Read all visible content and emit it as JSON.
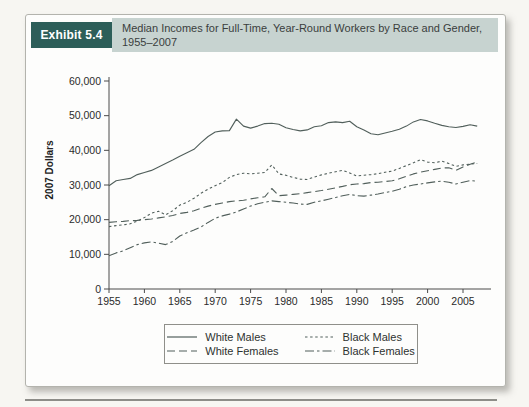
{
  "header": {
    "exhibit_label": "Exhibit 5.4",
    "title": "Median Incomes for Full-Time, Year-Round Workers by Race and Gender, 1955–2007"
  },
  "colors": {
    "exhibit_box_bg": "#2d5e59",
    "title_band_bg": "#c7d3d0",
    "line_color": "#515f5b",
    "axis_color": "#4b4b4b",
    "tick_text": "#2b2b2b"
  },
  "chart_data": {
    "type": "line",
    "title": "Median Incomes for Full-Time, Year-Round Workers by Race and Gender, 1955–2007",
    "xlabel": "",
    "ylabel": "2007 Dollars",
    "ylim": [
      0,
      60000
    ],
    "yticks": [
      0,
      10000,
      20000,
      30000,
      40000,
      50000,
      60000
    ],
    "ytick_labels": [
      "0",
      "10,000",
      "20,000",
      "30,000",
      "40,000",
      "50,000",
      "60,000"
    ],
    "xticks": [
      1955,
      1960,
      1965,
      1970,
      1975,
      1980,
      1985,
      1990,
      1995,
      2000,
      2005
    ],
    "grid": false,
    "legend_position": "bottom",
    "x": [
      1955,
      1956,
      1957,
      1958,
      1959,
      1960,
      1961,
      1962,
      1963,
      1964,
      1965,
      1966,
      1967,
      1968,
      1969,
      1970,
      1971,
      1972,
      1973,
      1974,
      1975,
      1976,
      1977,
      1978,
      1979,
      1980,
      1981,
      1982,
      1983,
      1984,
      1985,
      1986,
      1987,
      1988,
      1989,
      1990,
      1991,
      1992,
      1993,
      1994,
      1995,
      1996,
      1997,
      1998,
      1999,
      2000,
      2001,
      2002,
      2003,
      2004,
      2005,
      2006,
      2007
    ],
    "series": [
      {
        "name": "White Males",
        "style": "solid",
        "values": [
          29800,
          31200,
          31600,
          31900,
          33000,
          33600,
          34200,
          35200,
          36200,
          37200,
          38300,
          39300,
          40300,
          42200,
          44000,
          45300,
          45600,
          45700,
          49000,
          47000,
          46400,
          47000,
          47700,
          47800,
          47500,
          46500,
          46000,
          45600,
          45900,
          46800,
          47100,
          48000,
          48200,
          48000,
          48400,
          46800,
          45900,
          44800,
          44500,
          45000,
          45500,
          46100,
          47000,
          48200,
          48900,
          48500,
          47800,
          47200,
          46800,
          46600,
          46900,
          47400,
          47000
        ]
      },
      {
        "name": "White Females",
        "style": "dashed",
        "values": [
          19200,
          19400,
          19500,
          19700,
          19800,
          20000,
          20200,
          20500,
          20800,
          21200,
          21800,
          22100,
          22600,
          23300,
          23900,
          24400,
          24800,
          25200,
          25400,
          25600,
          26000,
          26300,
          26600,
          29000,
          26900,
          27100,
          27300,
          27500,
          27800,
          28100,
          28400,
          28800,
          29200,
          29600,
          30100,
          30300,
          30400,
          30700,
          30800,
          31000,
          31200,
          31800,
          32500,
          33200,
          33700,
          34100,
          34500,
          34900,
          35000,
          34200,
          35200,
          36000,
          36600
        ]
      },
      {
        "name": "Black Males",
        "style": "dotted",
        "values": [
          18000,
          18300,
          18500,
          18800,
          19600,
          20600,
          21900,
          22400,
          21400,
          22600,
          24200,
          25000,
          26200,
          27600,
          28800,
          29800,
          30700,
          32200,
          33000,
          33400,
          33200,
          33400,
          33600,
          35800,
          33200,
          32800,
          32200,
          31700,
          31600,
          32300,
          32900,
          33400,
          33800,
          34200,
          33500,
          32600,
          32800,
          33000,
          33300,
          33700,
          34000,
          34800,
          35600,
          36400,
          37300,
          36600,
          36400,
          36900,
          36200,
          35400,
          35800,
          36000,
          36200
        ]
      },
      {
        "name": "Black Females",
        "style": "dashdot",
        "values": [
          9600,
          10400,
          11000,
          11900,
          12800,
          13300,
          13600,
          13200,
          12800,
          13700,
          15300,
          16200,
          17000,
          17900,
          19200,
          20400,
          21100,
          21600,
          22200,
          23100,
          23900,
          24600,
          25000,
          25400,
          25200,
          25000,
          24800,
          24500,
          24400,
          25000,
          25400,
          25900,
          26400,
          26900,
          27300,
          26900,
          26800,
          27100,
          27400,
          27800,
          28200,
          28800,
          29500,
          30000,
          30300,
          30600,
          30900,
          31100,
          30800,
          30300,
          30800,
          31300,
          31100
        ]
      }
    ]
  }
}
